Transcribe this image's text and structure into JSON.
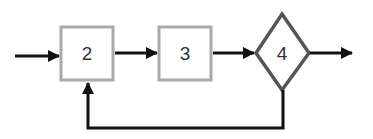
{
  "diagram": {
    "type": "flow",
    "colors": {
      "box_border": "#a9a9a9",
      "diamond_border": "#555555",
      "arrow": "#111111",
      "label": "#333333",
      "background": "#ffffff"
    },
    "nodes": [
      {
        "id": "2",
        "shape": "rectangle",
        "label": "2"
      },
      {
        "id": "3",
        "shape": "rectangle",
        "label": "3"
      },
      {
        "id": "4",
        "shape": "diamond",
        "label": "4"
      }
    ],
    "edges": [
      {
        "from": "input",
        "to": "2"
      },
      {
        "from": "2",
        "to": "3"
      },
      {
        "from": "3",
        "to": "4"
      },
      {
        "from": "4",
        "to": "output"
      },
      {
        "from": "4",
        "to": "2",
        "kind": "feedback"
      }
    ]
  }
}
